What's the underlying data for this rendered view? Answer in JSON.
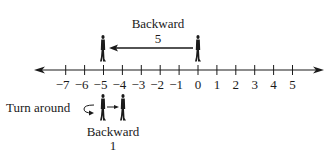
{
  "diagram": {
    "type": "number-line",
    "ticks": [
      -7,
      -6,
      -5,
      -4,
      -3,
      -2,
      -1,
      0,
      1,
      2,
      3,
      4,
      5
    ],
    "tick_labels": [
      "−7",
      "−6",
      "−5",
      "−4",
      "−3",
      "−2",
      "−1",
      "0",
      "1",
      "2",
      "3",
      "4",
      "5"
    ],
    "top_move": {
      "label_line1": "Backward",
      "label_line2": "5",
      "from": 0,
      "to": -5
    },
    "bottom_move": {
      "side_label": "Turn around",
      "label_line1": "Backward",
      "label_line2": "1",
      "from": -5,
      "to": -4
    },
    "colors": {
      "ink": "#1a1a1a",
      "background": "#ffffff"
    }
  }
}
